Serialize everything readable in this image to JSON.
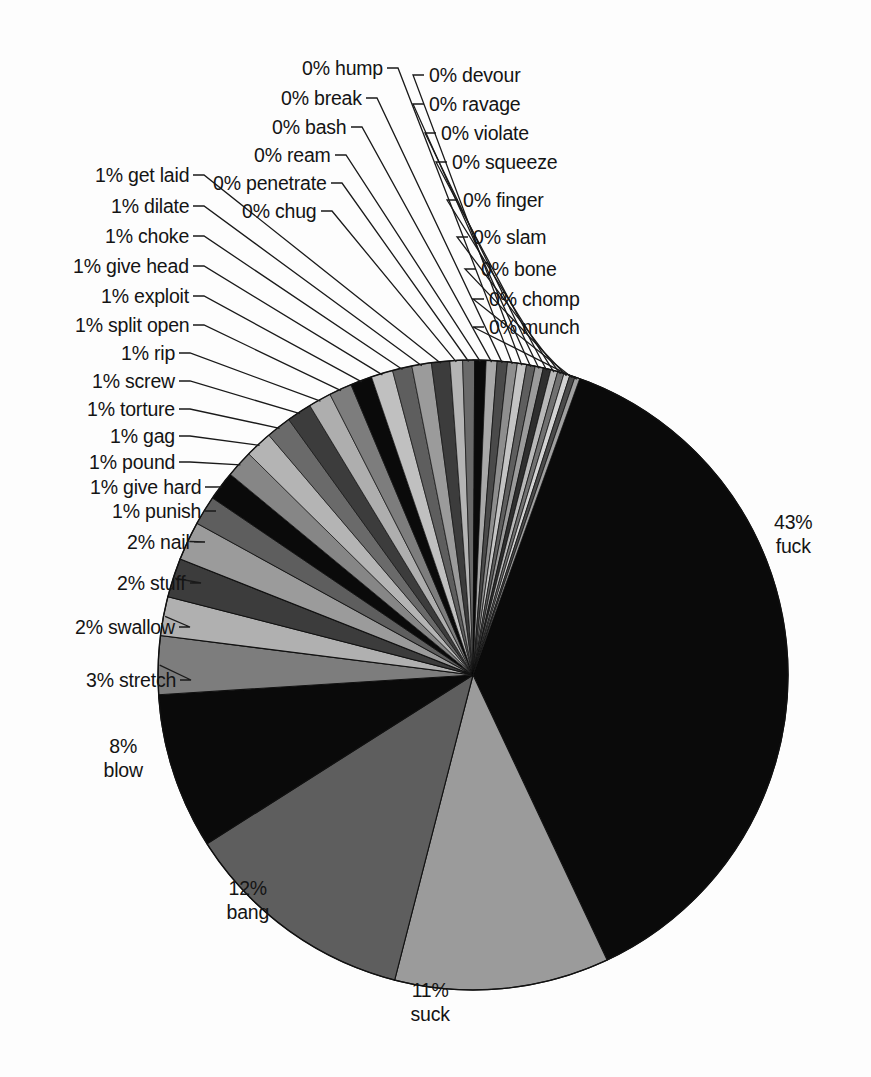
{
  "chart_data": {
    "type": "pie",
    "title": "",
    "subtitle": "",
    "xlabel": "",
    "ylabel": "",
    "legend_position": "callout-labels",
    "grid": false,
    "total_label_format": "{value}% {name}",
    "start_angle_deg": 0,
    "direction": "clockwise",
    "categories": [
      "fuck",
      "suck",
      "bang",
      "blow",
      "stretch",
      "swallow",
      "stuff",
      "nail",
      "punish",
      "give hard",
      "pound",
      "gag",
      "torture",
      "screw",
      "rip",
      "split open",
      "exploit",
      "give head",
      "choke",
      "dilate",
      "get laid",
      "chug",
      "penetrate",
      "ream",
      "bash",
      "break",
      "hump",
      "devour",
      "ravage",
      "violate",
      "squeeze",
      "finger",
      "slam",
      "bone",
      "chomp",
      "munch"
    ],
    "values": [
      43,
      11,
      12,
      8,
      3,
      2,
      2,
      2,
      1,
      1,
      1,
      1,
      1,
      1,
      1,
      1,
      1,
      1,
      1,
      1,
      1,
      0,
      0,
      0,
      0,
      0,
      0,
      0,
      0,
      0,
      0,
      0,
      0,
      0,
      0,
      0
    ],
    "slices": [
      {
        "name": "fuck",
        "value": 43,
        "label": "43%",
        "label_line2": "fuck",
        "color": "#0a0a0a",
        "sweep_deg": 154.8
      },
      {
        "name": "suck",
        "value": 11,
        "label": "11%",
        "label_line2": "suck",
        "color": "#9b9b9b",
        "sweep_deg": 39.6
      },
      {
        "name": "bang",
        "value": 12,
        "label": "12%",
        "label_line2": "bang",
        "color": "#5e5e5e",
        "sweep_deg": 43.2
      },
      {
        "name": "blow",
        "value": 8,
        "label": "8%",
        "label_line2": "blow",
        "color": "#0a0a0a",
        "sweep_deg": 28.8
      },
      {
        "name": "stretch",
        "value": 3,
        "label": "3% stretch",
        "color": "#7d7d7d",
        "sweep_deg": 10.8
      },
      {
        "name": "swallow",
        "value": 2,
        "label": "2% swallow",
        "color": "#b0b0b0",
        "sweep_deg": 7.2
      },
      {
        "name": "stuff",
        "value": 2,
        "label": "2% stuff",
        "color": "#3c3c3c",
        "sweep_deg": 7.2
      },
      {
        "name": "nail",
        "value": 2,
        "label": "2% nail",
        "color": "#9b9b9b",
        "sweep_deg": 7.2
      },
      {
        "name": "punish",
        "value": 1,
        "label": "1% punish",
        "color": "#5e5e5e",
        "sweep_deg": 5.4
      },
      {
        "name": "give hard",
        "value": 1,
        "label": "1% give hard",
        "color": "#0a0a0a",
        "sweep_deg": 5.4
      },
      {
        "name": "pound",
        "value": 1,
        "label": "1% pound",
        "color": "#868686",
        "sweep_deg": 5.0
      },
      {
        "name": "gag",
        "value": 1,
        "label": "1% gag",
        "color": "#b4b4b4",
        "sweep_deg": 5.0
      },
      {
        "name": "torture",
        "value": 1,
        "label": "1% torture",
        "color": "#6a6a6a",
        "sweep_deg": 4.6
      },
      {
        "name": "screw",
        "value": 1,
        "label": "1% screw",
        "color": "#3c3c3c",
        "sweep_deg": 4.6
      },
      {
        "name": "rip",
        "value": 1,
        "label": "1% rip",
        "color": "#aeaeae",
        "sweep_deg": 4.2
      },
      {
        "name": "split open",
        "value": 1,
        "label": "1% split open",
        "color": "#7d7d7d",
        "sweep_deg": 4.2
      },
      {
        "name": "exploit",
        "value": 1,
        "label": "1% exploit",
        "color": "#0a0a0a",
        "sweep_deg": 4.0
      },
      {
        "name": "give head",
        "value": 1,
        "label": "1% give head",
        "color": "#c0c0c0",
        "sweep_deg": 4.0
      },
      {
        "name": "choke",
        "value": 1,
        "label": "1% choke",
        "color": "#5e5e5e",
        "sweep_deg": 3.6
      },
      {
        "name": "dilate",
        "value": 1,
        "label": "1% dilate",
        "color": "#9b9b9b",
        "sweep_deg": 3.6
      },
      {
        "name": "get laid",
        "value": 1,
        "label": "1% get laid",
        "color": "#3c3c3c",
        "sweep_deg": 3.4
      },
      {
        "name": "chug",
        "value": 0,
        "label": "0% chug",
        "color": "#b4b4b4",
        "sweep_deg": 2.3
      },
      {
        "name": "penetrate",
        "value": 0,
        "label": "0% penetrate",
        "color": "#6a6a6a",
        "sweep_deg": 2.2
      },
      {
        "name": "ream",
        "value": 0,
        "label": "0% ream",
        "color": "#0a0a0a",
        "sweep_deg": 2.1
      },
      {
        "name": "bash",
        "value": 0,
        "label": "0% bash",
        "color": "#a8a8a8",
        "sweep_deg": 2.0
      },
      {
        "name": "break",
        "value": 0,
        "label": "0% break",
        "color": "#4a4a4a",
        "sweep_deg": 1.9
      },
      {
        "name": "hump",
        "value": 0,
        "label": "0% hump",
        "color": "#8e8e8e",
        "sweep_deg": 1.8
      },
      {
        "name": "devour",
        "value": 0,
        "label": "0% devour",
        "color": "#c4c4c4",
        "sweep_deg": 1.7
      },
      {
        "name": "ravage",
        "value": 0,
        "label": "0% ravage",
        "color": "#5e5e5e",
        "sweep_deg": 1.6
      },
      {
        "name": "violate",
        "value": 0,
        "label": "0% violate",
        "color": "#9b9b9b",
        "sweep_deg": 1.5
      },
      {
        "name": "squeeze",
        "value": 0,
        "label": "0% squeeze",
        "color": "#2f2f2f",
        "sweep_deg": 1.4
      },
      {
        "name": "finger",
        "value": 0,
        "label": "0% finger",
        "color": "#b8b8b8",
        "sweep_deg": 1.3
      },
      {
        "name": "slam",
        "value": 0,
        "label": "0% slam",
        "color": "#707070",
        "sweep_deg": 1.2
      },
      {
        "name": "bone",
        "value": 0,
        "label": "0% bone",
        "color": "#d2d2d2",
        "sweep_deg": 1.1
      },
      {
        "name": "chomp",
        "value": 0,
        "label": "0% chomp",
        "color": "#4a4a4a",
        "sweep_deg": 1.0
      },
      {
        "name": "munch",
        "value": 0,
        "label": "0% munch",
        "color": "#a0a0a0",
        "sweep_deg": 0.9
      }
    ]
  },
  "geometry": {
    "center_x": 473,
    "center_y": 675,
    "radius": 315
  },
  "labels": {
    "right_outside": [
      {
        "name": "fuck",
        "line1": "43%",
        "line2": "fuck",
        "x": 793,
        "y": 534
      }
    ],
    "bottom_outside": [
      {
        "name": "suck",
        "line1": "11%",
        "line2": "suck",
        "x": 430,
        "y": 1002
      },
      {
        "name": "bang",
        "line1": "12%",
        "line2": "bang",
        "x": 248,
        "y": 900
      },
      {
        "name": "blow",
        "line1": "8%",
        "line2": "blow",
        "x": 123,
        "y": 758
      }
    ],
    "left_column": [
      {
        "name": "get laid",
        "text": "1% get laid",
        "x": 189,
        "y": 175
      },
      {
        "name": "dilate",
        "text": "1% dilate",
        "x": 189,
        "y": 206
      },
      {
        "name": "choke",
        "text": "1% choke",
        "x": 189,
        "y": 236
      },
      {
        "name": "give head",
        "text": "1% give head",
        "x": 189,
        "y": 266
      },
      {
        "name": "exploit",
        "text": "1% exploit",
        "x": 189,
        "y": 296
      },
      {
        "name": "split open",
        "text": "1% split open",
        "x": 189,
        "y": 325
      },
      {
        "name": "rip",
        "text": "1% rip",
        "x": 175,
        "y": 353
      },
      {
        "name": "screw",
        "text": "1% screw",
        "x": 175,
        "y": 381
      },
      {
        "name": "torture",
        "text": "1% torture",
        "x": 175,
        "y": 409
      },
      {
        "name": "gag",
        "text": "1% gag",
        "x": 175,
        "y": 436
      },
      {
        "name": "pound",
        "text": "1% pound",
        "x": 175,
        "y": 462
      },
      {
        "name": "give hard",
        "text": "1% give hard",
        "x": 201,
        "y": 487
      },
      {
        "name": "punish",
        "text": "1% punish",
        "x": 201,
        "y": 511
      },
      {
        "name": "nail",
        "text": "2% nail",
        "x": 190,
        "y": 542
      },
      {
        "name": "stuff",
        "text": "2% stuff",
        "x": 186,
        "y": 583
      },
      {
        "name": "swallow",
        "text": "2% swallow",
        "x": 175,
        "y": 627
      },
      {
        "name": "stretch",
        "text": "3% stretch",
        "x": 176,
        "y": 680
      }
    ],
    "top_left_column": [
      {
        "name": "hump",
        "text": "0% hump",
        "x": 383,
        "y": 68
      },
      {
        "name": "break",
        "text": "0% break",
        "x": 362,
        "y": 98
      },
      {
        "name": "bash",
        "text": "0% bash",
        "x": 347,
        "y": 127
      },
      {
        "name": "ream",
        "text": "0% ream",
        "x": 331,
        "y": 155
      },
      {
        "name": "penetrate",
        "text": "0% penetrate",
        "x": 327,
        "y": 183
      },
      {
        "name": "chug",
        "text": "0% chug",
        "x": 317,
        "y": 211
      }
    ],
    "top_right_column": [
      {
        "name": "devour",
        "text": "0% devour",
        "x": 429,
        "y": 75
      },
      {
        "name": "ravage",
        "text": "0% ravage",
        "x": 429,
        "y": 104
      },
      {
        "name": "violate",
        "text": "0% violate",
        "x": 441,
        "y": 133
      },
      {
        "name": "squeeze",
        "text": "0% squeeze",
        "x": 452,
        "y": 162
      },
      {
        "name": "finger",
        "text": "0% finger",
        "x": 463,
        "y": 200
      },
      {
        "name": "slam",
        "text": "0% slam",
        "x": 473,
        "y": 237
      },
      {
        "name": "bone",
        "text": "0% bone",
        "x": 481,
        "y": 269
      },
      {
        "name": "chomp",
        "text": "0% chomp",
        "x": 489,
        "y": 299
      },
      {
        "name": "munch",
        "text": "0% munch",
        "x": 489,
        "y": 327
      }
    ]
  }
}
